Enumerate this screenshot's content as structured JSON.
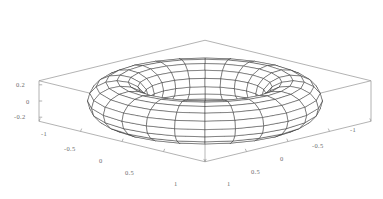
{
  "figure": {
    "kind": "3d-surface-wireframe",
    "surface_name": "torus",
    "background_color": "#ffffff",
    "mesh_color": "#1a1a1a",
    "box_color": "#9a9a9a",
    "tick_label_color": "#6d6d6d",
    "hidden_surface_fill": "#ffffff"
  },
  "axes": {
    "z_axis": {
      "name": "vertical-axis",
      "ticks": [
        {
          "label": "0.2",
          "value": 0.2,
          "x": 16,
          "y": 82
        },
        {
          "label": "0",
          "value": 0,
          "x": 26,
          "y": 99
        },
        {
          "label": "-0.2",
          "value": -0.2,
          "x": 14,
          "y": 114
        }
      ]
    },
    "x_axis": {
      "name": "left-front-axis",
      "ticks": [
        {
          "label": "-1",
          "value": -1,
          "x": 41,
          "y": 131
        },
        {
          "label": "-0.5",
          "value": -0.5,
          "x": 64,
          "y": 146
        },
        {
          "label": "0",
          "value": 0,
          "x": 99,
          "y": 158
        },
        {
          "label": "0.5",
          "value": 0.5,
          "x": 125,
          "y": 170
        },
        {
          "label": "1",
          "value": 1,
          "x": 174,
          "y": 181
        }
      ]
    },
    "y_axis": {
      "name": "right-front-axis",
      "ticks": [
        {
          "label": "-1",
          "value": -1,
          "x": 350,
          "y": 127
        },
        {
          "label": "-0.5",
          "value": -0.5,
          "x": 312,
          "y": 143
        },
        {
          "label": "0",
          "value": 0,
          "x": 280,
          "y": 156
        },
        {
          "label": "0.5",
          "value": 0.5,
          "x": 251,
          "y": 169
        },
        {
          "label": "1",
          "value": 1,
          "x": 227,
          "y": 181
        }
      ]
    }
  },
  "chart_data": {
    "type": "surface",
    "title": "",
    "xlabel": "",
    "ylabel": "",
    "zlabel": "",
    "parametric_surface": {
      "equation_u": "x = (R + r*cos(v)) * cos(u)",
      "equation_v": "y = (R + r*cos(v)) * sin(u)",
      "equation_w": "z = r * sin(v)",
      "major_radius_R": 0.75,
      "minor_radius_r": 0.25,
      "u_range": [
        0,
        6.2831853
      ],
      "v_range": [
        0,
        6.2831853
      ],
      "u_divisions": 24,
      "v_divisions": 16
    },
    "xlim": [
      -1,
      1
    ],
    "ylim": [
      -1,
      1
    ],
    "zlim": [
      -0.25,
      0.25
    ],
    "xticks": [
      -1,
      -0.5,
      0,
      0.5,
      1
    ],
    "yticks": [
      -1,
      -0.5,
      0,
      0.5,
      1
    ],
    "zticks": [
      -0.2,
      0,
      0.2
    ],
    "grid": false,
    "legend": null,
    "projection": {
      "type": "orthographic",
      "view_elevation_deg": 30,
      "view_azimuth_deg": 45,
      "z_exaggeration": 1.0
    },
    "box": {
      "visible": true,
      "edges_drawn": [
        "bottom-floor-quad",
        "left-vertical",
        "right-vertical",
        "front-vertical",
        "back-top-edges"
      ]
    }
  }
}
